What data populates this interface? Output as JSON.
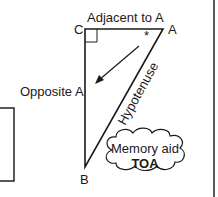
{
  "diagram": {
    "vertices": {
      "c": "C",
      "a": "A",
      "b": "B"
    },
    "sides": {
      "adjacent": "Adjacent to A",
      "opposite": "Opposite A",
      "hypotenuse": "Hypotenuse"
    },
    "angle_marker": "*",
    "cloud": {
      "line1": "Memory aid",
      "line2": "TOA"
    }
  }
}
